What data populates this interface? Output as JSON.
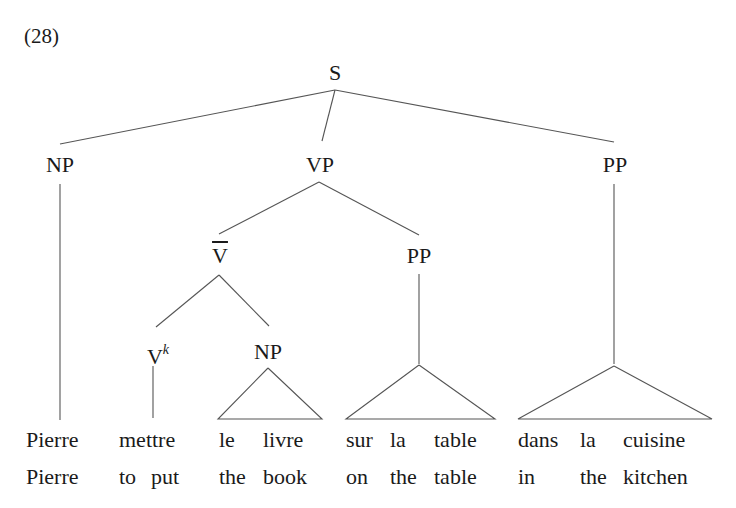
{
  "example_number": "(28)",
  "tree": {
    "root": "S",
    "level1": [
      "NP",
      "VP",
      "PP"
    ],
    "vp_children": [
      "V",
      "PP"
    ],
    "vbar_children": [
      "V",
      "NP"
    ],
    "vbar_label": "V",
    "vk_base": "V",
    "vk_sup": "k"
  },
  "french_row": [
    {
      "text": "Pierre",
      "x": 26
    },
    {
      "text": "mettre",
      "x": 119
    },
    {
      "text": "le",
      "x": 219
    },
    {
      "text": "livre",
      "x": 263
    },
    {
      "text": "sur",
      "x": 346
    },
    {
      "text": "la",
      "x": 390
    },
    {
      "text": "table",
      "x": 434
    },
    {
      "text": "dans",
      "x": 518
    },
    {
      "text": "la",
      "x": 580
    },
    {
      "text": "cuisine",
      "x": 623
    }
  ],
  "gloss_row": [
    {
      "text": "Pierre",
      "x": 26
    },
    {
      "text": "to",
      "x": 119
    },
    {
      "text": "put",
      "x": 151
    },
    {
      "text": "the",
      "x": 219
    },
    {
      "text": "book",
      "x": 263
    },
    {
      "text": "on",
      "x": 346
    },
    {
      "text": "the",
      "x": 390
    },
    {
      "text": "table",
      "x": 434
    },
    {
      "text": "in",
      "x": 518
    },
    {
      "text": "the",
      "x": 580
    },
    {
      "text": "kitchen",
      "x": 623
    }
  ],
  "colors": {
    "ink": "#1a1a1a",
    "lines": "#555555"
  }
}
